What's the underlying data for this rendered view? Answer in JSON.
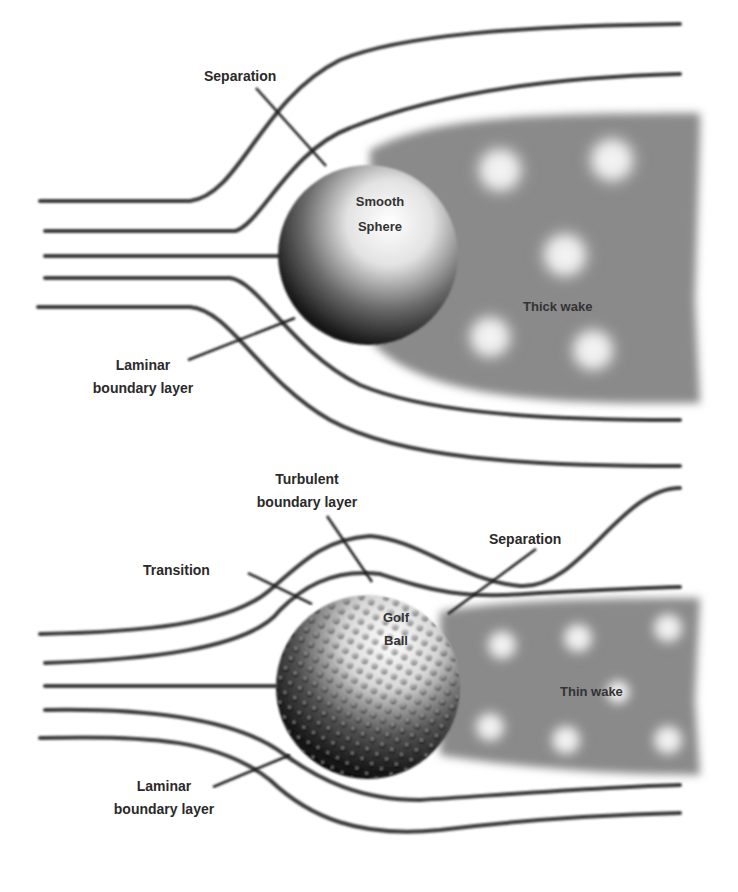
{
  "diagram": {
    "colors": {
      "background": "#ffffff",
      "streamline": "#3a3a3a",
      "wake": "#8a8a8a",
      "vortex": "#f4f4f4",
      "text": "#2a2a2a"
    },
    "top_panel": {
      "object_label_line1": "Smooth",
      "object_label_line2": "Sphere",
      "separation_label": "Separation",
      "laminar_label_line1": "Laminar",
      "laminar_label_line2": "boundary layer",
      "wake_label": "Thick wake"
    },
    "bottom_panel": {
      "object_label_line1": "Golf",
      "object_label_line2": "Ball",
      "turbulent_label_line1": "Turbulent",
      "turbulent_label_line2": "boundary layer",
      "transition_label": "Transition",
      "separation_label": "Separation",
      "laminar_label_line1": "Laminar",
      "laminar_label_line2": "boundary layer",
      "wake_label": "Thin wake"
    }
  }
}
